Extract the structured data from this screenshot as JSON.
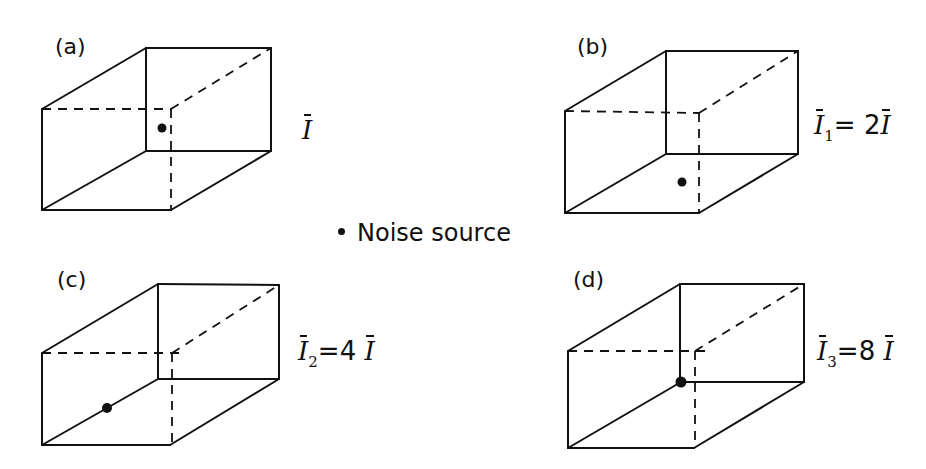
{
  "figure": {
    "legend": {
      "marker": "filled-dot",
      "label": "Noise source"
    },
    "panels": [
      {
        "id": "a",
        "label": "(a)",
        "intensity_label": {
          "symbol": "I",
          "subscript": "",
          "equals": "",
          "factor": "",
          "rhs_symbol": ""
        },
        "source_position": "inside room, near front-top-right vertical edge (room centre region)"
      },
      {
        "id": "b",
        "label": "(b)",
        "intensity_label": {
          "symbol": "I",
          "subscript": "1",
          "equals": "=",
          "factor": "2",
          "rhs_symbol": "I"
        },
        "source_position": "on floor"
      },
      {
        "id": "c",
        "label": "(c)",
        "intensity_label": {
          "symbol": "I",
          "subscript": "2",
          "equals": "=",
          "factor": "4",
          "rhs_symbol": "I"
        },
        "source_position": "at floor-wall edge"
      },
      {
        "id": "d",
        "label": "(d)",
        "intensity_label": {
          "symbol": "I",
          "subscript": "3",
          "equals": "=",
          "factor": "8",
          "rhs_symbol": "I"
        },
        "source_position": "in corner"
      }
    ],
    "colors": {
      "line": "#111111",
      "background": "#ffffff"
    }
  }
}
